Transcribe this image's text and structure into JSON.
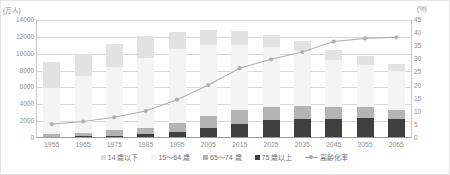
{
  "chart_data": {
    "type": "bar",
    "title": "",
    "xlabel": "",
    "ylabel": "",
    "grid": true,
    "legend_position": "bottom",
    "categories": [
      "1955",
      "1965",
      "1975",
      "1985",
      "1995",
      "2005",
      "2015",
      "2025",
      "2035",
      "2045",
      "2055",
      "2065"
    ],
    "left_axis": {
      "unit": "(万人)",
      "ylim": [
        0,
        14000
      ],
      "ticks": [
        "0",
        "2000",
        "4000",
        "6000",
        "8000",
        "10000",
        "12000",
        "14000"
      ],
      "tick_values": [
        0,
        2000,
        4000,
        6000,
        8000,
        10000,
        12000,
        14000
      ]
    },
    "right_axis": {
      "unit": "(%)",
      "ylim": [
        0,
        45
      ],
      "ticks": [
        "0",
        "5",
        "10",
        "15",
        "20",
        "25",
        "30",
        "35",
        "40",
        "45"
      ],
      "tick_values": [
        0,
        5,
        10,
        15,
        20,
        25,
        30,
        35,
        40,
        45
      ]
    },
    "series": [
      {
        "name": "14 歳以下",
        "color": "#e2e2e2",
        "axis": "left",
        "values": [
          2980,
          2553,
          2722,
          2603,
          2003,
          1759,
          1595,
          1407,
          1246,
          1138,
          1012,
          898
        ]
      },
      {
        "name": "15〜64 歳",
        "color": "#f4f4f4",
        "axis": "left",
        "values": [
          5517,
          6744,
          7581,
          8251,
          8726,
          8442,
          7728,
          7170,
          6494,
          5584,
          5028,
          4529
        ]
      },
      {
        "name": "65〜74 歳",
        "color": "#b4b4b4",
        "axis": "left",
        "values": [
          338,
          458,
          620,
          776,
          1109,
          1407,
          1734,
          1497,
          1522,
          1442,
          1248,
          1133
        ]
      },
      {
        "name": "75 歳以上",
        "color": "#3f3f3f",
        "axis": "left",
        "values": [
          138,
          189,
          284,
          471,
          717,
          1160,
          1632,
          2180,
          2260,
          2277,
          2401,
          2248
        ]
      }
    ],
    "line_series": {
      "name": "高齢化率",
      "color": "#b0b0b0",
      "axis": "right",
      "marker": "circle",
      "values": [
        5.3,
        6.3,
        7.9,
        10.3,
        14.6,
        20.2,
        26.6,
        30.0,
        32.8,
        36.8,
        38.0,
        38.4
      ]
    }
  },
  "legend": {
    "items": [
      {
        "label": "14 歳以下",
        "name": "legend-under-14"
      },
      {
        "label": "15〜64 歳",
        "name": "legend-15-64"
      },
      {
        "label": "65〜74 歳",
        "name": "legend-65-74"
      },
      {
        "label": "75 歳以上",
        "name": "legend-75-over"
      },
      {
        "label": "高齢化率",
        "name": "legend-aging-rate"
      }
    ]
  }
}
